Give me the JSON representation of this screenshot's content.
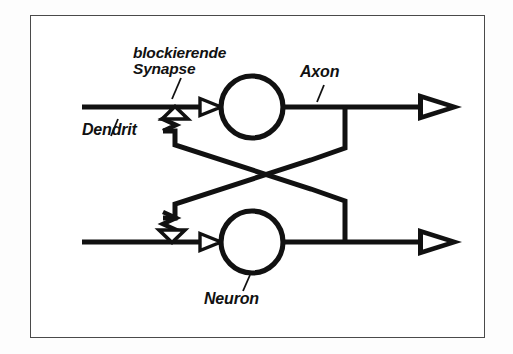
{
  "diagram": {
    "title_alt": "Neuronales Netz mit blockierender Synapse",
    "labels": {
      "synapse": "blockierende\nSynapse",
      "dendrite": "Dendrit",
      "axon": "Axon",
      "neuron": "Neuron"
    },
    "colors": {
      "ink": "#111111",
      "frame": "#4a4a4a",
      "paper": "#ffffff",
      "page": "#fdfdfd"
    },
    "elements": {
      "neuron_top_icon": "circle-icon",
      "neuron_bottom_icon": "circle-icon",
      "synapse_top_icon": "zigzag-inhibitory-synapse-icon",
      "synapse_bottom_icon": "zigzag-inhibitory-synapse-icon",
      "axon_top_terminal_icon": "arrowhead-icon",
      "axon_bottom_terminal_icon": "arrowhead-icon",
      "dendrite_top_input_icon": "open-arrowhead-icon",
      "dendrite_bottom_input_icon": "open-arrowhead-icon",
      "crossing_icon": "crossed-feedback-lines-icon",
      "frame_icon": "page-border-icon"
    },
    "geometry": {
      "frame": {
        "x": 30,
        "y": 15,
        "w": 455,
        "h": 323
      },
      "dendrite_top_y": 107,
      "dendrite_bottom_y": 242,
      "dendrite_start_x": 82,
      "neuron_top": {
        "cx": 252,
        "cy": 107,
        "r": 31
      },
      "neuron_bottom": {
        "cx": 252,
        "cy": 242,
        "r": 31
      },
      "axon_end_x": 460,
      "tap_top_x": 345,
      "tap_bottom_x": 345,
      "synapse_top_x": 175,
      "synapse_bottom_x": 172
    }
  }
}
